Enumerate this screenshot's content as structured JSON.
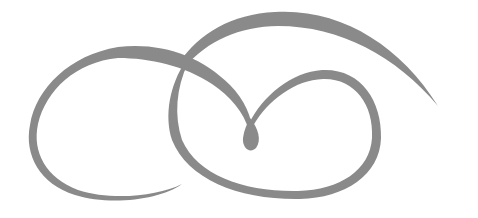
{
  "image": {
    "description": "Decorative calligraphic flourish ornament",
    "background": "#ffffff",
    "stroke_color": "#8a8a8a"
  }
}
